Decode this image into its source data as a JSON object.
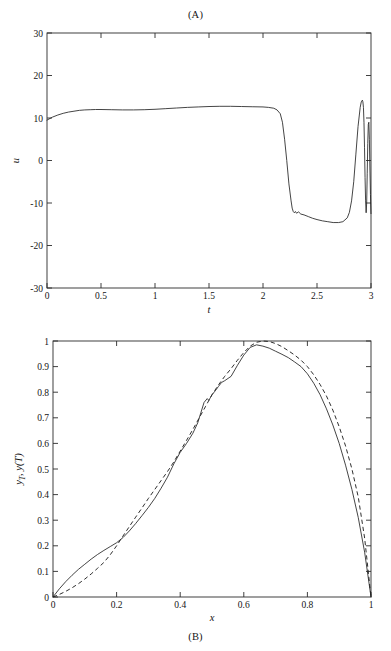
{
  "figure": {
    "background": "#ffffff",
    "line_color": "#232323"
  },
  "panel_a": {
    "caption": "(A)",
    "xlabel": "t",
    "ylabel": "u",
    "xticks": [
      "0",
      "0.5",
      "1",
      "1.5",
      "2",
      "2.5",
      "3"
    ],
    "yticks": [
      "30",
      "20",
      "10",
      "0",
      "-10",
      "-20",
      "-30"
    ]
  },
  "panel_b": {
    "caption": "(B)",
    "xlabel": "x",
    "ylabel_parts": {
      "y": "y",
      "sub": "T",
      "comma": ", ",
      "yt": "y",
      "paren": "(T)"
    },
    "xticks": [
      "0",
      "0.2",
      "0.4",
      "0.6",
      "0.8",
      "1"
    ],
    "yticks": [
      "0",
      "0.1",
      "0.2",
      "0.3",
      "0.4",
      "0.5",
      "0.6",
      "0.7",
      "0.8",
      "0.9",
      "1"
    ]
  },
  "chart_data": [
    {
      "type": "line",
      "panel": "(A)",
      "title": "(A)",
      "xlabel": "t",
      "ylabel": "u",
      "xlim": [
        0,
        3
      ],
      "ylim": [
        -30,
        30
      ],
      "xticks": [
        0,
        0.5,
        1,
        1.5,
        2,
        2.5,
        3
      ],
      "yticks": [
        -30,
        -20,
        -10,
        0,
        10,
        20,
        30
      ],
      "grid": false,
      "legend": "none",
      "series": [
        {
          "name": "u(t) optimal control",
          "style": "solid",
          "x": [
            0.0,
            0.05,
            0.1,
            0.15,
            0.2,
            0.25,
            0.3,
            0.35,
            0.4,
            0.45,
            0.5,
            0.6,
            0.7,
            0.8,
            0.9,
            1.0,
            1.1,
            1.2,
            1.3,
            1.4,
            1.5,
            1.6,
            1.7,
            1.8,
            1.9,
            2.0,
            2.05,
            2.1,
            2.13,
            2.16,
            2.18,
            2.2,
            2.22,
            2.24,
            2.26,
            2.27,
            2.28,
            2.29,
            2.3,
            2.31,
            2.33,
            2.35,
            2.38,
            2.42,
            2.46,
            2.5,
            2.55,
            2.6,
            2.65,
            2.7,
            2.74,
            2.78,
            2.8,
            2.82,
            2.84,
            2.86,
            2.88,
            2.9,
            2.91,
            2.92,
            2.925,
            2.93,
            2.935,
            2.94,
            2.945,
            2.95,
            2.955,
            2.96,
            2.965,
            2.97,
            2.975,
            2.98,
            2.985,
            2.99,
            2.995,
            3.0
          ],
          "y": [
            9.5,
            10.2,
            10.7,
            11.1,
            11.4,
            11.6,
            11.8,
            11.9,
            11.95,
            12.0,
            12.0,
            11.95,
            11.9,
            11.9,
            11.95,
            12.05,
            12.2,
            12.35,
            12.5,
            12.6,
            12.7,
            12.75,
            12.75,
            12.7,
            12.65,
            12.6,
            12.5,
            12.3,
            11.9,
            11.0,
            9.0,
            5.0,
            0.0,
            -5.5,
            -9.5,
            -11.2,
            -12.0,
            -12.3,
            -12.0,
            -12.4,
            -12.1,
            -12.6,
            -12.8,
            -13.2,
            -13.6,
            -13.9,
            -14.2,
            -14.4,
            -14.6,
            -14.6,
            -14.4,
            -13.5,
            -12.2,
            -9.5,
            -5.0,
            1.5,
            8.0,
            12.5,
            13.8,
            14.2,
            13.8,
            12.5,
            9.0,
            3.0,
            -4.0,
            -9.5,
            -12.3,
            -10.0,
            -3.0,
            4.0,
            8.5,
            9.0,
            5.0,
            -2.0,
            -8.0,
            -12.5
          ],
          "description": "Control starts near 9.5, plateaus around 12-12.8 until t=2.1, drops sharply to about -12 by t=2.28 with small ripples, decreases slowly to -14.6 near t=2.7, then rises steeply to a peak of 14.2 near t=2.92 and enters rapid high-amplitude oscillations between about +9 and -12.5 approaching t=3"
        }
      ]
    },
    {
      "type": "line",
      "panel": "(B)",
      "title": "(B)",
      "xlabel": "x",
      "ylabel": "yT, y(T)",
      "xlim": [
        0,
        1
      ],
      "ylim": [
        0,
        1
      ],
      "xticks": [
        0,
        0.2,
        0.4,
        0.6,
        0.8,
        1
      ],
      "yticks": [
        0,
        0.1,
        0.2,
        0.3,
        0.4,
        0.5,
        0.6,
        0.7,
        0.8,
        0.9,
        1
      ],
      "grid": false,
      "legend": "none",
      "series": [
        {
          "name": "y(T) computed state",
          "style": "solid",
          "x": [
            0.0,
            0.02,
            0.04,
            0.06,
            0.08,
            0.1,
            0.12,
            0.14,
            0.16,
            0.18,
            0.2,
            0.22,
            0.24,
            0.26,
            0.28,
            0.3,
            0.32,
            0.34,
            0.36,
            0.38,
            0.4,
            0.42,
            0.44,
            0.455,
            0.465,
            0.475,
            0.485,
            0.49,
            0.5,
            0.51,
            0.52,
            0.53,
            0.54,
            0.56,
            0.58,
            0.6,
            0.62,
            0.64,
            0.66,
            0.68,
            0.7,
            0.72,
            0.74,
            0.76,
            0.78,
            0.8,
            0.82,
            0.84,
            0.86,
            0.88,
            0.9,
            0.92,
            0.94,
            0.96,
            0.98,
            1.0
          ],
          "y": [
            0.0,
            0.032,
            0.06,
            0.085,
            0.108,
            0.128,
            0.148,
            0.166,
            0.182,
            0.197,
            0.212,
            0.232,
            0.258,
            0.287,
            0.318,
            0.35,
            0.385,
            0.425,
            0.468,
            0.52,
            0.565,
            0.6,
            0.64,
            0.68,
            0.72,
            0.76,
            0.775,
            0.768,
            0.79,
            0.805,
            0.822,
            0.838,
            0.845,
            0.862,
            0.905,
            0.945,
            0.975,
            0.985,
            0.98,
            0.972,
            0.96,
            0.948,
            0.935,
            0.918,
            0.9,
            0.872,
            0.835,
            0.79,
            0.735,
            0.672,
            0.6,
            0.515,
            0.42,
            0.31,
            0.175,
            0.0
          ],
          "description": "Computed terminal state: rises from 0 with a steep initial slope, nearly linear through the middle with a small kink near x=0.48, peaks at about 0.985 around x=0.62-0.64, then falls steeply back to 0 at x=1"
        },
        {
          "name": "yT target profile",
          "style": "dashed",
          "x": [
            0.0,
            0.02,
            0.04,
            0.06,
            0.08,
            0.1,
            0.12,
            0.14,
            0.16,
            0.18,
            0.2,
            0.22,
            0.24,
            0.26,
            0.28,
            0.3,
            0.32,
            0.34,
            0.36,
            0.38,
            0.4,
            0.42,
            0.44,
            0.46,
            0.48,
            0.5,
            0.52,
            0.54,
            0.56,
            0.58,
            0.6,
            0.62,
            0.64,
            0.66,
            0.68,
            0.7,
            0.72,
            0.74,
            0.76,
            0.78,
            0.8,
            0.82,
            0.84,
            0.86,
            0.88,
            0.9,
            0.92,
            0.94,
            0.96,
            0.98,
            1.0
          ],
          "y": [
            0.0,
            0.01,
            0.022,
            0.036,
            0.052,
            0.07,
            0.09,
            0.112,
            0.135,
            0.165,
            0.2,
            0.238,
            0.275,
            0.312,
            0.348,
            0.385,
            0.42,
            0.455,
            0.49,
            0.528,
            0.57,
            0.612,
            0.655,
            0.7,
            0.745,
            0.79,
            0.828,
            0.862,
            0.892,
            0.925,
            0.955,
            0.98,
            0.995,
            1.0,
            0.998,
            0.99,
            0.978,
            0.962,
            0.945,
            0.925,
            0.9,
            0.868,
            0.83,
            0.785,
            0.73,
            0.665,
            0.59,
            0.5,
            0.39,
            0.23,
            0.0
          ],
          "description": "Target profile: smooth convex rise from 0, crosses the solid curve near x=0.2, peaks at 1.0 around x=0.66, then decreases to 0 at x=1"
        }
      ]
    }
  ]
}
